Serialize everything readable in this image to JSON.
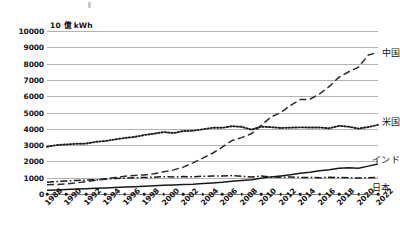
{
  "chart_data": {
    "type": "line",
    "title": "",
    "subtitle": "",
    "xlabel": "",
    "ylabel": "10 億 kWh",
    "ylim": [
      0,
      10000
    ],
    "ytick_step": 1000,
    "yticks": [
      "10000",
      "9000",
      "8000",
      "7000",
      "6000",
      "5000",
      "4000",
      "3000",
      "2000",
      "1000",
      "0"
    ],
    "xlim": [
      1988,
      2022
    ],
    "xticks": [
      "1988",
      "1990",
      "1992",
      "1994",
      "1996",
      "1998",
      "2000",
      "2002",
      "2004",
      "2006",
      "2008",
      "2010",
      "2012",
      "2014",
      "2016",
      "2018",
      "2020",
      "2022"
    ],
    "x": [
      1988,
      1989,
      1990,
      1991,
      1992,
      1993,
      1994,
      1995,
      1996,
      1997,
      1998,
      1999,
      2000,
      2001,
      2002,
      2003,
      2004,
      2005,
      2006,
      2007,
      2008,
      2009,
      2010,
      2011,
      2012,
      2013,
      2014,
      2015,
      2016,
      2017,
      2018,
      2019,
      2020,
      2021,
      2022
    ],
    "grid": true,
    "legend_position": "right-inline",
    "series": [
      {
        "name": "中国",
        "style": "dashed",
        "color": "#2b2b2b",
        "label_x": 2022,
        "label_y": 8700,
        "values": [
          560,
          585,
          620,
          680,
          760,
          840,
          930,
          1010,
          1090,
          1140,
          1170,
          1240,
          1360,
          1480,
          1650,
          1910,
          2200,
          2500,
          2870,
          3280,
          3460,
          3700,
          4210,
          4720,
          4990,
          5430,
          5790,
          5810,
          6140,
          6600,
          7170,
          7500,
          7780,
          8530,
          8690
        ]
      },
      {
        "name": "米国",
        "style": "dotted",
        "color": "#1f1f1f",
        "label_x": 2022,
        "label_y": 4500,
        "values": [
          2900,
          3000,
          3040,
          3080,
          3090,
          3200,
          3250,
          3350,
          3440,
          3500,
          3620,
          3700,
          3800,
          3740,
          3860,
          3880,
          3970,
          4060,
          4060,
          4160,
          4120,
          3950,
          4130,
          4100,
          4050,
          4070,
          4090,
          4080,
          4080,
          4030,
          4180,
          4130,
          4010,
          4110,
          4240
        ]
      },
      {
        "name": "インド",
        "style": "solid",
        "color": "#1a1a1a",
        "label_x": 2021,
        "label_y": 2150,
        "values": [
          230,
          250,
          280,
          300,
          320,
          350,
          375,
          400,
          425,
          450,
          470,
          500,
          530,
          550,
          580,
          600,
          640,
          680,
          720,
          780,
          830,
          880,
          960,
          1050,
          1110,
          1180,
          1280,
          1330,
          1420,
          1490,
          1580,
          1610,
          1580,
          1710,
          1840
        ]
      },
      {
        "name": "日本",
        "style": "dashdot",
        "color": "#1a1a1a",
        "label_x": 2021,
        "label_y": 430,
        "values": [
          720,
          760,
          800,
          830,
          850,
          870,
          910,
          950,
          970,
          1000,
          1010,
          1030,
          1060,
          1040,
          1070,
          1050,
          1090,
          1100,
          1110,
          1130,
          1090,
          1040,
          1100,
          1050,
          1030,
          1040,
          1020,
          1010,
          1000,
          1020,
          1010,
          1000,
          980,
          1000,
          1010
        ]
      }
    ]
  }
}
